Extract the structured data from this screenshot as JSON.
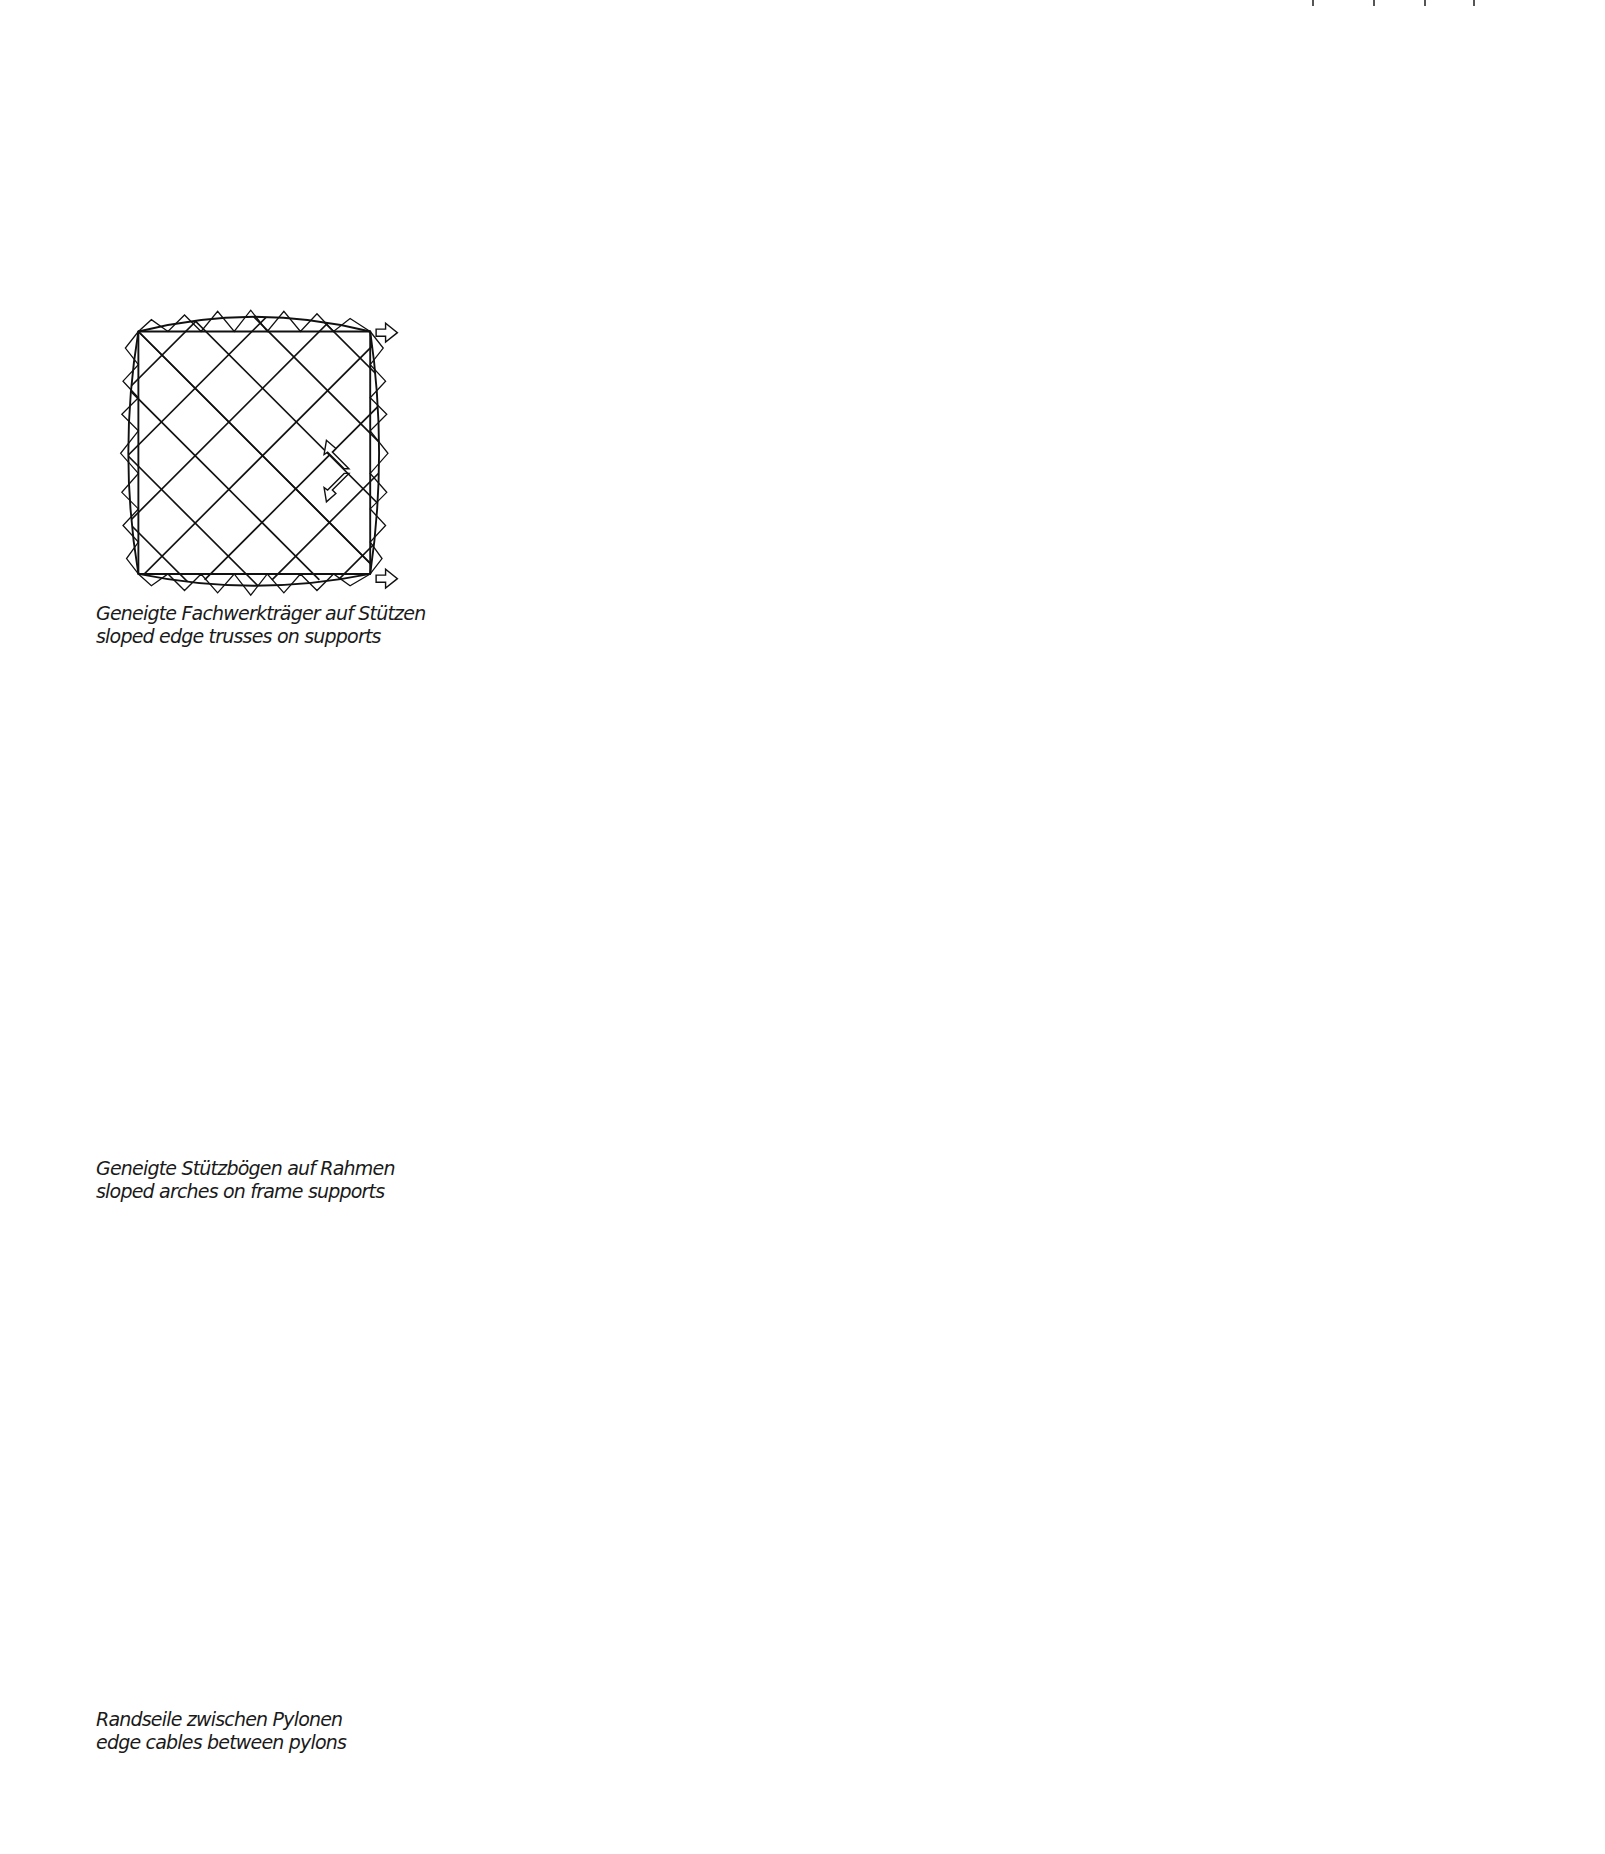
{
  "page": {
    "background": "#ffffff",
    "ink_color": "#111111"
  },
  "figures": [
    {
      "id": "sloped-edge-trusses",
      "caption_de": "Geneigte Fachwerkträger auf Stützen",
      "caption_en": "sloped edge trusses on supports",
      "plan": "square grid net bounded by curved edge trusses, force arrows outward",
      "perspective": "saddle net with triangulated edge trusses on dashed supports"
    },
    {
      "id": "sloped-arches-frame",
      "caption_de": "Geneigte Stützbögen auf Rahmen",
      "caption_en": "sloped arches on frame supports",
      "plan": "diagonal net inside ring arch with four frame legs, dashed base square",
      "perspective": "saddle net framed by continuous ring arch on inclined legs"
    },
    {
      "id": "edge-cables-pylons",
      "caption_de": "Randseile zwischen Pylonen",
      "caption_en": "edge cables between pylons",
      "plan": "diagonal net with concave edge cables anchored at corners",
      "perspective": "saddle net tensioned by edge cables between two pylons"
    }
  ]
}
